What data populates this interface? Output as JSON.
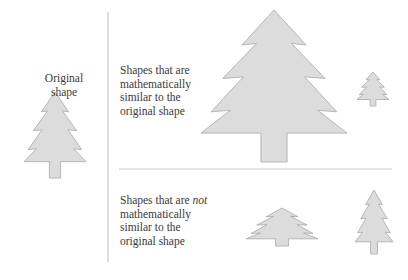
{
  "labels": {
    "original": [
      "Original",
      "shape"
    ],
    "similar": [
      "Shapes that are",
      "mathematically",
      "similar to the",
      "original shape"
    ],
    "not_similar": {
      "line1_prefix": "Shapes that are ",
      "line1_emph": "not",
      "rest": [
        "mathematically",
        "similar to the",
        "original shape"
      ]
    }
  },
  "colors": {
    "tree_fill": "#dcdcdc",
    "tree_stroke": "#a8a8a8",
    "divider": "#c8c8c8"
  },
  "trees": [
    {
      "id": "original",
      "cx": 55,
      "top": 92,
      "width": 62,
      "height": 86,
      "group": "original"
    },
    {
      "id": "similar-large",
      "cx": 274,
      "top": 10,
      "width": 146,
      "height": 152,
      "group": "similar"
    },
    {
      "id": "similar-small",
      "cx": 373,
      "top": 72,
      "width": 32,
      "height": 34,
      "group": "similar"
    },
    {
      "id": "not-similar-wide",
      "cx": 282,
      "top": 208,
      "width": 72,
      "height": 38,
      "group": "not_similar"
    },
    {
      "id": "not-similar-tall",
      "cx": 374,
      "top": 190,
      "width": 38,
      "height": 64,
      "group": "not_similar"
    }
  ],
  "dividers": {
    "vertical": {
      "x": 108,
      "y1": 12,
      "y2": 262
    },
    "horizontal": {
      "y": 169,
      "x1": 119,
      "x2": 392
    }
  }
}
